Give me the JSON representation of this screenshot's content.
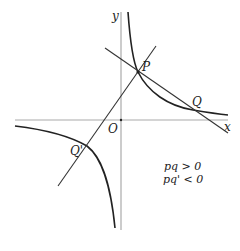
{
  "diagram": {
    "title": "",
    "axes": {
      "x_label": "x",
      "y_label": "y",
      "origin_label": "O"
    },
    "curve": "hyperbola y = k/x (k > 0), two branches in quadrants I and III",
    "points": [
      {
        "id": "P",
        "label": "P",
        "branch": "right"
      },
      {
        "id": "Q",
        "label": "Q",
        "branch": "right"
      },
      {
        "id": "Qprime",
        "label": "Q'",
        "branch": "left"
      }
    ],
    "lines": [
      {
        "id": "line-PQ",
        "through": [
          "P",
          "Q"
        ]
      },
      {
        "id": "line-OP",
        "through": [
          "Q'",
          "O",
          "P"
        ]
      }
    ],
    "conditions": [
      "pq > 0",
      "pq' < 0"
    ],
    "colors": {
      "axes": "#aaaaaa",
      "curve": "#222222",
      "lines": "#333333",
      "text": "#222222"
    }
  }
}
